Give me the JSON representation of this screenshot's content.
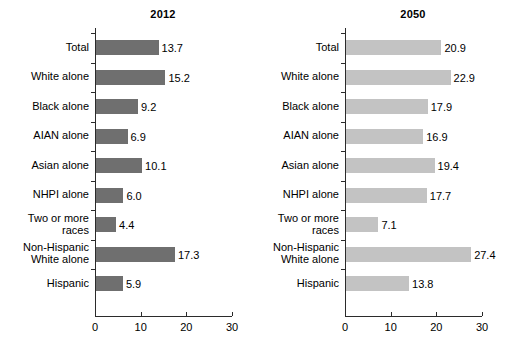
{
  "chart_data": [
    {
      "type": "bar",
      "orientation": "horizontal",
      "title": "2012",
      "xlabel": "",
      "ylabel": "",
      "xlim": [
        0,
        30
      ],
      "xticks": [
        0,
        10,
        20,
        30
      ],
      "xtick_labels": [
        "0",
        "10",
        "20",
        "30"
      ],
      "grid": false,
      "legend": false,
      "bar_color": "#6f6f6f",
      "categories": [
        "Total",
        "White alone",
        "Black alone",
        "AIAN alone",
        "Asian alone",
        "NHPI alone",
        "Two or more races",
        "Non-Hispanic White alone",
        "Hispanic"
      ],
      "category_lines": [
        [
          "Total"
        ],
        [
          "White alone"
        ],
        [
          "Black alone"
        ],
        [
          "AIAN alone"
        ],
        [
          "Asian alone"
        ],
        [
          "NHPI alone"
        ],
        [
          "Two or more",
          "races"
        ],
        [
          "Non-Hispanic",
          "White alone"
        ],
        [
          "Hispanic"
        ]
      ],
      "values": [
        13.7,
        15.2,
        9.2,
        6.9,
        10.1,
        6.0,
        4.4,
        17.3,
        5.9
      ],
      "value_labels": [
        "13.7",
        "15.2",
        "9.2",
        "6.9",
        "10.1",
        "6.0",
        "4.4",
        "17.3",
        "5.9"
      ]
    },
    {
      "type": "bar",
      "orientation": "horizontal",
      "title": "2050",
      "xlabel": "",
      "ylabel": "",
      "xlim": [
        0,
        30
      ],
      "xticks": [
        0,
        10,
        20,
        30
      ],
      "xtick_labels": [
        "0",
        "10",
        "20",
        "30"
      ],
      "grid": false,
      "legend": false,
      "bar_color": "#c3c3c3",
      "categories": [
        "Total",
        "White alone",
        "Black alone",
        "AIAN alone",
        "Asian alone",
        "NHPI alone",
        "Two or more races",
        "Non-Hispanic White alone",
        "Hispanic"
      ],
      "category_lines": [
        [
          "Total"
        ],
        [
          "White alone"
        ],
        [
          "Black alone"
        ],
        [
          "AIAN alone"
        ],
        [
          "Asian alone"
        ],
        [
          "NHPI alone"
        ],
        [
          "Two or more",
          "races"
        ],
        [
          "Non-Hispanic",
          "White alone"
        ],
        [
          "Hispanic"
        ]
      ],
      "values": [
        20.9,
        22.9,
        17.9,
        16.9,
        19.4,
        17.7,
        7.1,
        27.4,
        13.8
      ],
      "value_labels": [
        "20.9",
        "22.9",
        "17.9",
        "16.9",
        "19.4",
        "17.7",
        "7.1",
        "27.4",
        "13.8"
      ]
    }
  ],
  "panels": [
    {
      "title": "2012"
    },
    {
      "title": "2050"
    }
  ]
}
